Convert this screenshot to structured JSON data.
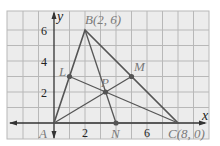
{
  "diagram": {
    "type": "coordinate-geometry-triangle",
    "axes": {
      "x_label": "x",
      "y_label": "y",
      "x_ticks": [
        "2",
        "6"
      ],
      "y_ticks": [
        "2",
        "4",
        "6"
      ]
    },
    "points": {
      "A": {
        "label": "A",
        "coords": [
          0,
          0
        ]
      },
      "B": {
        "label": "B(2, 6)",
        "coords": [
          2,
          6
        ]
      },
      "C": {
        "label": "C(8, 0)",
        "coords": [
          8,
          0
        ]
      },
      "L": {
        "label": "L",
        "coords": [
          1,
          3
        ]
      },
      "M": {
        "label": "M",
        "coords": [
          5,
          3
        ]
      },
      "N": {
        "label": "N",
        "coords": [
          4,
          0
        ]
      },
      "P": {
        "label": "P",
        "coords": [
          3.33,
          2
        ]
      }
    },
    "colors": {
      "grid_bg": "#ececec",
      "grid_line": "#b8b8b8",
      "triangle": "#555555",
      "axis": "#333333",
      "point": "#555555",
      "label": "#7a7a7a"
    }
  }
}
